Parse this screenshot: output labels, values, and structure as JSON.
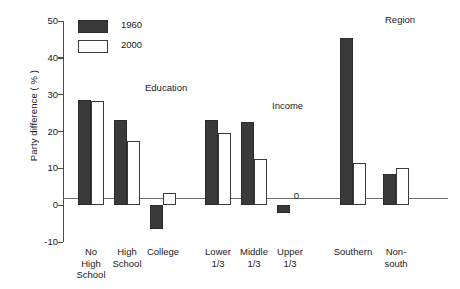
{
  "chart_data": {
    "type": "bar",
    "title": "",
    "xlabel": "",
    "ylabel": "Party difference ( % )",
    "ylim": [
      -10,
      50
    ],
    "yticks": [
      -10,
      0,
      10,
      20,
      30,
      40,
      50
    ],
    "ytick_labels": [
      "-10",
      "0",
      "10",
      "20",
      "30",
      "40",
      "50"
    ],
    "grid": false,
    "legend_position": "top-left",
    "categories": [
      "No\nHigh\nSchool",
      "High\nSchool",
      "College",
      "Lower\n1/3",
      "Middle\n1/3",
      "Upper\n1/3",
      "Southern",
      "Non-\nsouth"
    ],
    "series": [
      {
        "name": "1960",
        "color": "#3a3a3a",
        "values": [
          28.5,
          23.0,
          -6.5,
          23.0,
          22.5,
          -2.0,
          45.5,
          8.5
        ]
      },
      {
        "name": "2000",
        "color": "#ffffff",
        "values": [
          28.3,
          17.5,
          3.2,
          19.5,
          12.5,
          0.0,
          11.5,
          10.0
        ]
      }
    ],
    "group_headers": [
      {
        "label": "Education",
        "over_categories": [
          "No High School",
          "High School",
          "College"
        ]
      },
      {
        "label": "Income",
        "over_categories": [
          "Lower 1/3",
          "Middle 1/3",
          "Upper 1/3"
        ]
      },
      {
        "label": "Region",
        "over_categories": [
          "Southern",
          "Non-south"
        ]
      }
    ],
    "annotations": [
      {
        "text": "0",
        "category": "Upper 1/3",
        "series": "2000",
        "note": "value label for zero-height bar"
      }
    ]
  },
  "legend": {
    "items": [
      {
        "label": "1960",
        "style": "filled-dark"
      },
      {
        "label": "2000",
        "style": "outlined-white"
      }
    ]
  },
  "axes": {
    "y_label": "Party difference ( % )",
    "y_tick_labels": [
      "50",
      "40",
      "30",
      "20",
      "10",
      "0",
      "-10"
    ]
  },
  "colors": {
    "bar_1960": "#3a3a3a",
    "bar_2000": "#ffffff",
    "bar_outline": "#3a3a3a",
    "axis": "#4a4a4a",
    "baseline": "#6a6a6a",
    "text": "#1a1a1a",
    "background": "#ffffff"
  }
}
